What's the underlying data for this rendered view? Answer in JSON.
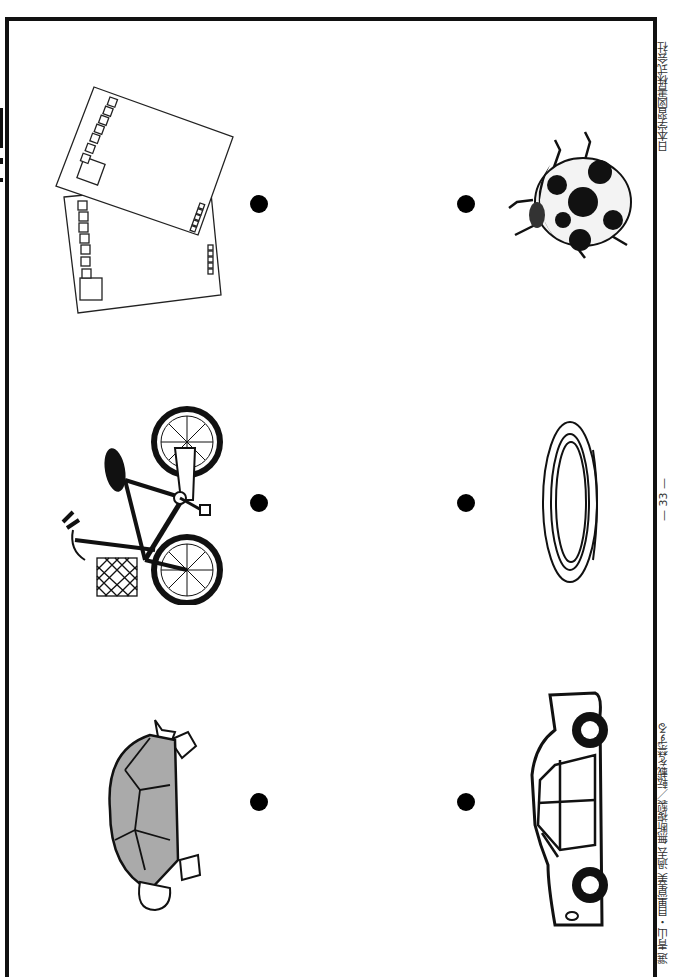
{
  "page": {
    "orientation": "rotated-90",
    "footer": {
      "publisher": "日本学習図書株式会社",
      "page_number": "— 33 —",
      "copyright": "選 青山・目黒星美 過去 無断複製／転載を禁ずる"
    }
  },
  "left_column": [
    {
      "item": "postcards",
      "icon": "postcards-icon"
    },
    {
      "item": "bicycle",
      "icon": "bicycle-icon"
    },
    {
      "item": "turtle",
      "icon": "turtle-icon"
    }
  ],
  "right_column": [
    {
      "item": "ladybug",
      "icon": "ladybug-icon"
    },
    {
      "item": "ring",
      "icon": "ring-icon"
    },
    {
      "item": "car",
      "icon": "car-icon"
    }
  ],
  "dots_count": 6
}
